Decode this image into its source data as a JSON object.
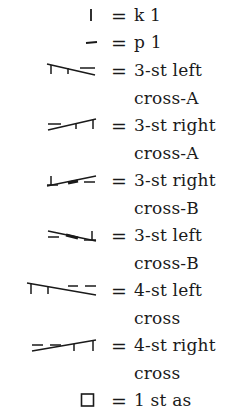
{
  "legend": {
    "items": [
      {
        "symbol": "knit-vertical-bar",
        "equals": "=",
        "line1": "k 1",
        "line2": ""
      },
      {
        "symbol": "purl-horizontal-dash",
        "equals": "=",
        "line1": "p 1",
        "line2": ""
      },
      {
        "symbol": "3-st-left-cross-a",
        "equals": "=",
        "line1": "3-st left",
        "line2": "cross-A"
      },
      {
        "symbol": "3-st-right-cross-a",
        "equals": "=",
        "line1": "3-st right",
        "line2": "cross-A"
      },
      {
        "symbol": "3-st-right-cross-b",
        "equals": "=",
        "line1": "3-st right",
        "line2": "cross-B"
      },
      {
        "symbol": "3-st-left-cross-b",
        "equals": "=",
        "line1": "3-st left",
        "line2": "cross-B"
      },
      {
        "symbol": "4-st-left-cross",
        "equals": "=",
        "line1": "4-st left",
        "line2": "cross"
      },
      {
        "symbol": "4-st-right-cross",
        "equals": "=",
        "line1": "4-st right",
        "line2": "cross"
      },
      {
        "symbol": "empty-square",
        "equals": "=",
        "line1": "1 st as",
        "line2": ""
      }
    ]
  }
}
